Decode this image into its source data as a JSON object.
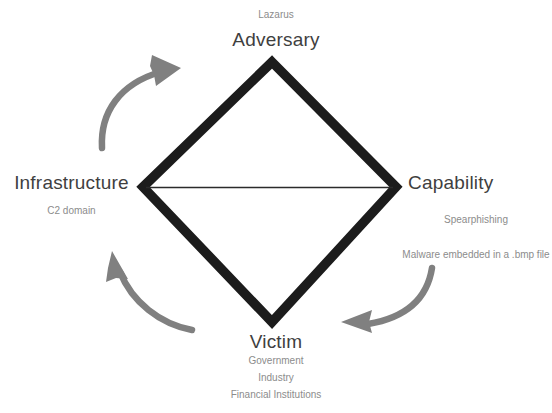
{
  "diagram": {
    "type": "diamond-model",
    "colors": {
      "diamond_stroke": "#1c1c1c",
      "axis_line": "#2b2b2b",
      "arrow": "#808080",
      "title_text": "#3f3f3f",
      "sub_text": "#8c8c8c",
      "background": "#ffffff"
    },
    "vertices": [
      {
        "id": "adversary",
        "label": "Adversary",
        "position": "top",
        "details": [
          "Lazarus"
        ],
        "details_position": "above"
      },
      {
        "id": "infrastructure",
        "label": "Infrastructure",
        "position": "left",
        "details": [
          "C2 domain"
        ],
        "details_position": "below"
      },
      {
        "id": "capability",
        "label": "Capability",
        "position": "right",
        "details": [
          "Spearphishing",
          "Malware embedded in a .bmp file"
        ],
        "details_position": "below"
      },
      {
        "id": "victim",
        "label": "Victim",
        "position": "bottom",
        "details": [
          "Government",
          "Industry",
          "Financial Institutions"
        ],
        "details_position": "below"
      }
    ],
    "arrows": [
      {
        "id": "infrastructure-to-adversary",
        "from": "infrastructure",
        "to": "adversary",
        "name": "arrow-infrastructure-to-adversary"
      },
      {
        "id": "victim-to-infrastructure",
        "from": "victim",
        "to": "infrastructure",
        "name": "arrow-victim-to-infrastructure"
      },
      {
        "id": "capability-to-victim",
        "from": "capability",
        "to": "victim",
        "name": "arrow-capability-to-victim"
      }
    ],
    "edges": [
      {
        "id": "axis-infrastructure-capability",
        "from": "infrastructure",
        "to": "capability"
      }
    ]
  }
}
